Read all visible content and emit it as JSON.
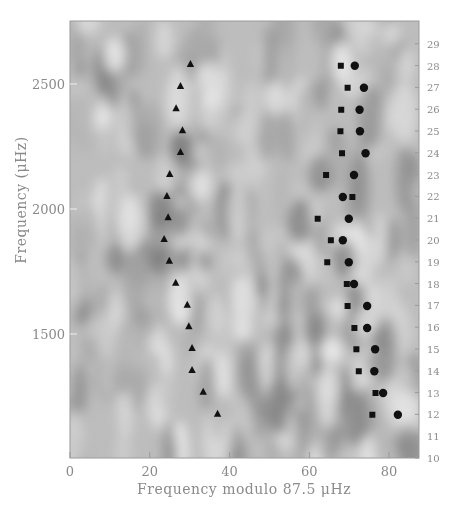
{
  "chart_data": {
    "type": "scatter",
    "title": "",
    "xlabel": "Frequency modulo 87.5 μHz",
    "ylabel": "Frequency (μHz)",
    "xlim": [
      0,
      87.5
    ],
    "ylim": [
      1000,
      2745
    ],
    "x_ticks": [
      0,
      20,
      40,
      60,
      80
    ],
    "y_ticks": [
      1500,
      2000,
      2500
    ],
    "right_axis": {
      "label": "radial order n",
      "ticks": [
        10,
        11,
        12,
        13,
        14,
        15,
        16,
        17,
        18,
        19,
        20,
        21,
        22,
        23,
        24,
        25,
        26,
        27,
        28,
        29
      ]
    },
    "background": "grayscale echelle power contour map",
    "series": [
      {
        "name": "l=2 / triangles",
        "marker": "triangle",
        "points": [
          {
            "x": 30.2,
            "y": 2580
          },
          {
            "x": 27.7,
            "y": 2492
          },
          {
            "x": 26.6,
            "y": 2403
          },
          {
            "x": 28.2,
            "y": 2315
          },
          {
            "x": 27.7,
            "y": 2228
          },
          {
            "x": 25.0,
            "y": 2140
          },
          {
            "x": 24.3,
            "y": 2052
          },
          {
            "x": 24.6,
            "y": 1967
          },
          {
            "x": 23.6,
            "y": 1880
          },
          {
            "x": 24.9,
            "y": 1793
          },
          {
            "x": 26.5,
            "y": 1705
          },
          {
            "x": 29.4,
            "y": 1617
          },
          {
            "x": 29.8,
            "y": 1531
          },
          {
            "x": 30.6,
            "y": 1444
          },
          {
            "x": 30.6,
            "y": 1356
          },
          {
            "x": 33.4,
            "y": 1269
          },
          {
            "x": 37.0,
            "y": 1181
          }
        ]
      },
      {
        "name": "l=0 / squares",
        "marker": "square",
        "points": [
          {
            "n": 28,
            "x": 67.9,
            "y": 2573
          },
          {
            "n": 27,
            "x": 69.6,
            "y": 2485
          },
          {
            "n": 26,
            "x": 68.0,
            "y": 2397
          },
          {
            "n": 25,
            "x": 67.8,
            "y": 2311
          },
          {
            "n": 24,
            "x": 68.2,
            "y": 2223
          },
          {
            "n": 23,
            "x": 64.2,
            "y": 2136
          },
          {
            "n": 22,
            "x": 70.8,
            "y": 2048
          },
          {
            "n": 21,
            "x": 62.1,
            "y": 1961
          },
          {
            "n": 20,
            "x": 65.4,
            "y": 1875
          },
          {
            "n": 19,
            "x": 64.5,
            "y": 1787
          },
          {
            "n": 18,
            "x": 69.4,
            "y": 1700
          },
          {
            "n": 17,
            "x": 69.6,
            "y": 1612
          },
          {
            "n": 16,
            "x": 71.3,
            "y": 1524
          },
          {
            "n": 15,
            "x": 71.8,
            "y": 1439
          },
          {
            "n": 14,
            "x": 72.4,
            "y": 1351
          },
          {
            "n": 13,
            "x": 76.6,
            "y": 1264
          },
          {
            "n": 12,
            "x": 75.8,
            "y": 1177
          }
        ]
      },
      {
        "name": "l=1 / circles",
        "marker": "circle",
        "points": [
          {
            "n": 28,
            "x": 71.4,
            "y": 2573
          },
          {
            "n": 27,
            "x": 73.7,
            "y": 2485
          },
          {
            "n": 26,
            "x": 72.6,
            "y": 2397
          },
          {
            "n": 25,
            "x": 72.7,
            "y": 2311
          },
          {
            "n": 24,
            "x": 74.1,
            "y": 2223
          },
          {
            "n": 23,
            "x": 71.2,
            "y": 2136
          },
          {
            "n": 22,
            "x": 68.4,
            "y": 2048
          },
          {
            "n": 21,
            "x": 69.9,
            "y": 1961
          },
          {
            "n": 20,
            "x": 68.4,
            "y": 1875
          },
          {
            "n": 19,
            "x": 69.9,
            "y": 1787
          },
          {
            "n": 18,
            "x": 71.2,
            "y": 1700
          },
          {
            "n": 17,
            "x": 74.5,
            "y": 1612
          },
          {
            "n": 16,
            "x": 74.5,
            "y": 1524
          },
          {
            "n": 15,
            "x": 76.5,
            "y": 1439
          },
          {
            "n": 14,
            "x": 76.3,
            "y": 1351
          },
          {
            "n": 13,
            "x": 78.5,
            "y": 1264
          },
          {
            "n": 12,
            "x": 82.2,
            "y": 1177
          }
        ]
      }
    ]
  },
  "layout": {
    "plot": {
      "left": 70,
      "top": 21,
      "right": 419,
      "bottom": 458
    },
    "y_px_per_uhz": 0.25,
    "y_ref": {
      "value": 2500,
      "px": 84
    },
    "order_px": {
      "first": 10,
      "first_y": 458,
      "spacing": 21.8
    }
  },
  "colors": {
    "marker": "#111111",
    "frame": "#9a9a9a",
    "label": "#8a8a8a",
    "bg_base": "#bdbdbd"
  }
}
